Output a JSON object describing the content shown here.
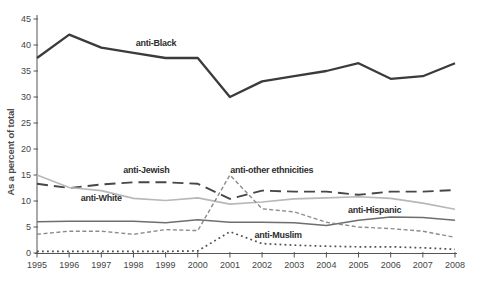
{
  "chart_data": {
    "type": "line",
    "title": "",
    "xlabel": "",
    "ylabel": "As a percent of total",
    "x": [
      1995,
      1996,
      1997,
      1998,
      1999,
      2000,
      2001,
      2002,
      2003,
      2004,
      2005,
      2006,
      2007,
      2008
    ],
    "ylim": [
      0,
      45
    ],
    "yticks": [
      0,
      5,
      10,
      15,
      20,
      25,
      30,
      35,
      40,
      45
    ],
    "grid": false,
    "legend": "inline-labels",
    "series": [
      {
        "name": "anti-Black",
        "line_style": "solid",
        "color": "#3b3b3b",
        "stroke_width": 2.3,
        "values": [
          37.5,
          42,
          39.5,
          38.5,
          37.5,
          37.5,
          30,
          33,
          34,
          35,
          36.5,
          33.5,
          34,
          36.5
        ],
        "label": {
          "text": "anti-Black",
          "x": 1998.7,
          "y": 39.8
        }
      },
      {
        "name": "anti-Jewish",
        "line_style": "long-dash",
        "color": "#474747",
        "stroke_width": 1.9,
        "values": [
          13.3,
          12.5,
          13.2,
          13.6,
          13.6,
          13.3,
          10.4,
          12,
          11.8,
          11.8,
          11.2,
          11.8,
          11.8,
          12.1
        ],
        "label": {
          "text": "anti-Jewish",
          "x": 1998.4,
          "y": 15.4
        }
      },
      {
        "name": "anti-White",
        "line_style": "solid",
        "color": "#b8b8b8",
        "stroke_width": 1.6,
        "values": [
          15,
          12.6,
          12,
          10.5,
          10.1,
          10.6,
          9.4,
          9.8,
          10.4,
          10.6,
          10.8,
          10.5,
          9.6,
          8.4
        ],
        "label": {
          "text": "anti-White",
          "x": 1997.0,
          "y": 10.0
        }
      },
      {
        "name": "anti-Hispanic",
        "line_style": "solid",
        "color": "#6e6e6e",
        "stroke_width": 1.5,
        "values": [
          6,
          6.1,
          6.1,
          6.1,
          5.8,
          6.4,
          5.9,
          5.9,
          5.8,
          5.3,
          6.3,
          6.9,
          6.8,
          6.3
        ],
        "label": {
          "text": "anti-Hispanic",
          "x": 2005.5,
          "y": 7.7
        }
      },
      {
        "name": "anti-other ethnicities",
        "line_style": "short-dash",
        "color": "#8c8c8c",
        "stroke_width": 1.4,
        "values": [
          3.6,
          4.2,
          4.2,
          3.6,
          4.5,
          4.3,
          15,
          8.5,
          7.9,
          5.9,
          5,
          4.7,
          4.2,
          3
        ],
        "label": {
          "text": "anti-other ethnicities",
          "x": 2002.3,
          "y": 15.4
        }
      },
      {
        "name": "anti-Muslim",
        "line_style": "dotted",
        "color": "#4f4f4f",
        "stroke_width": 1.7,
        "values": [
          0.3,
          0.3,
          0.3,
          0.3,
          0.3,
          0.4,
          4.1,
          1.8,
          1.5,
          1.3,
          1.2,
          1.2,
          1,
          0.7
        ],
        "label": {
          "text": "anti-Muslim",
          "x": 2002.5,
          "y": 2.9
        }
      }
    ]
  }
}
